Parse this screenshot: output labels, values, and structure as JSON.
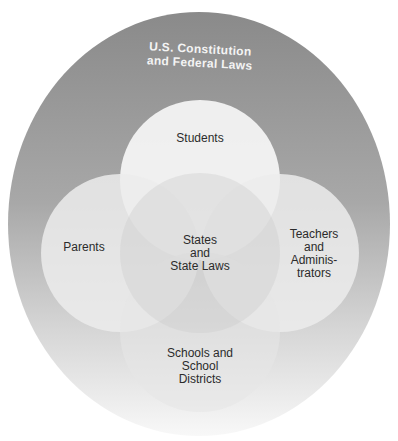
{
  "diagram": {
    "outer": {
      "label_line1": "U.S. Constitution",
      "label_line2": "and Federal Laws"
    },
    "center": {
      "line1": "States",
      "line2": "and",
      "line3": "State Laws"
    },
    "circles": {
      "students": {
        "line1": "Students"
      },
      "parents": {
        "line1": "Parents"
      },
      "teachers": {
        "line1": "Teachers",
        "line2": "and",
        "line3": "Adminis-",
        "line4": "trators"
      },
      "schools": {
        "line1": "Schools and",
        "line2": "School",
        "line3": "Districts"
      }
    }
  },
  "colors": {
    "outer_top": "#8a8a8a",
    "outer_bottom": "#f7f7f7",
    "circle": "#f2f2f2"
  }
}
